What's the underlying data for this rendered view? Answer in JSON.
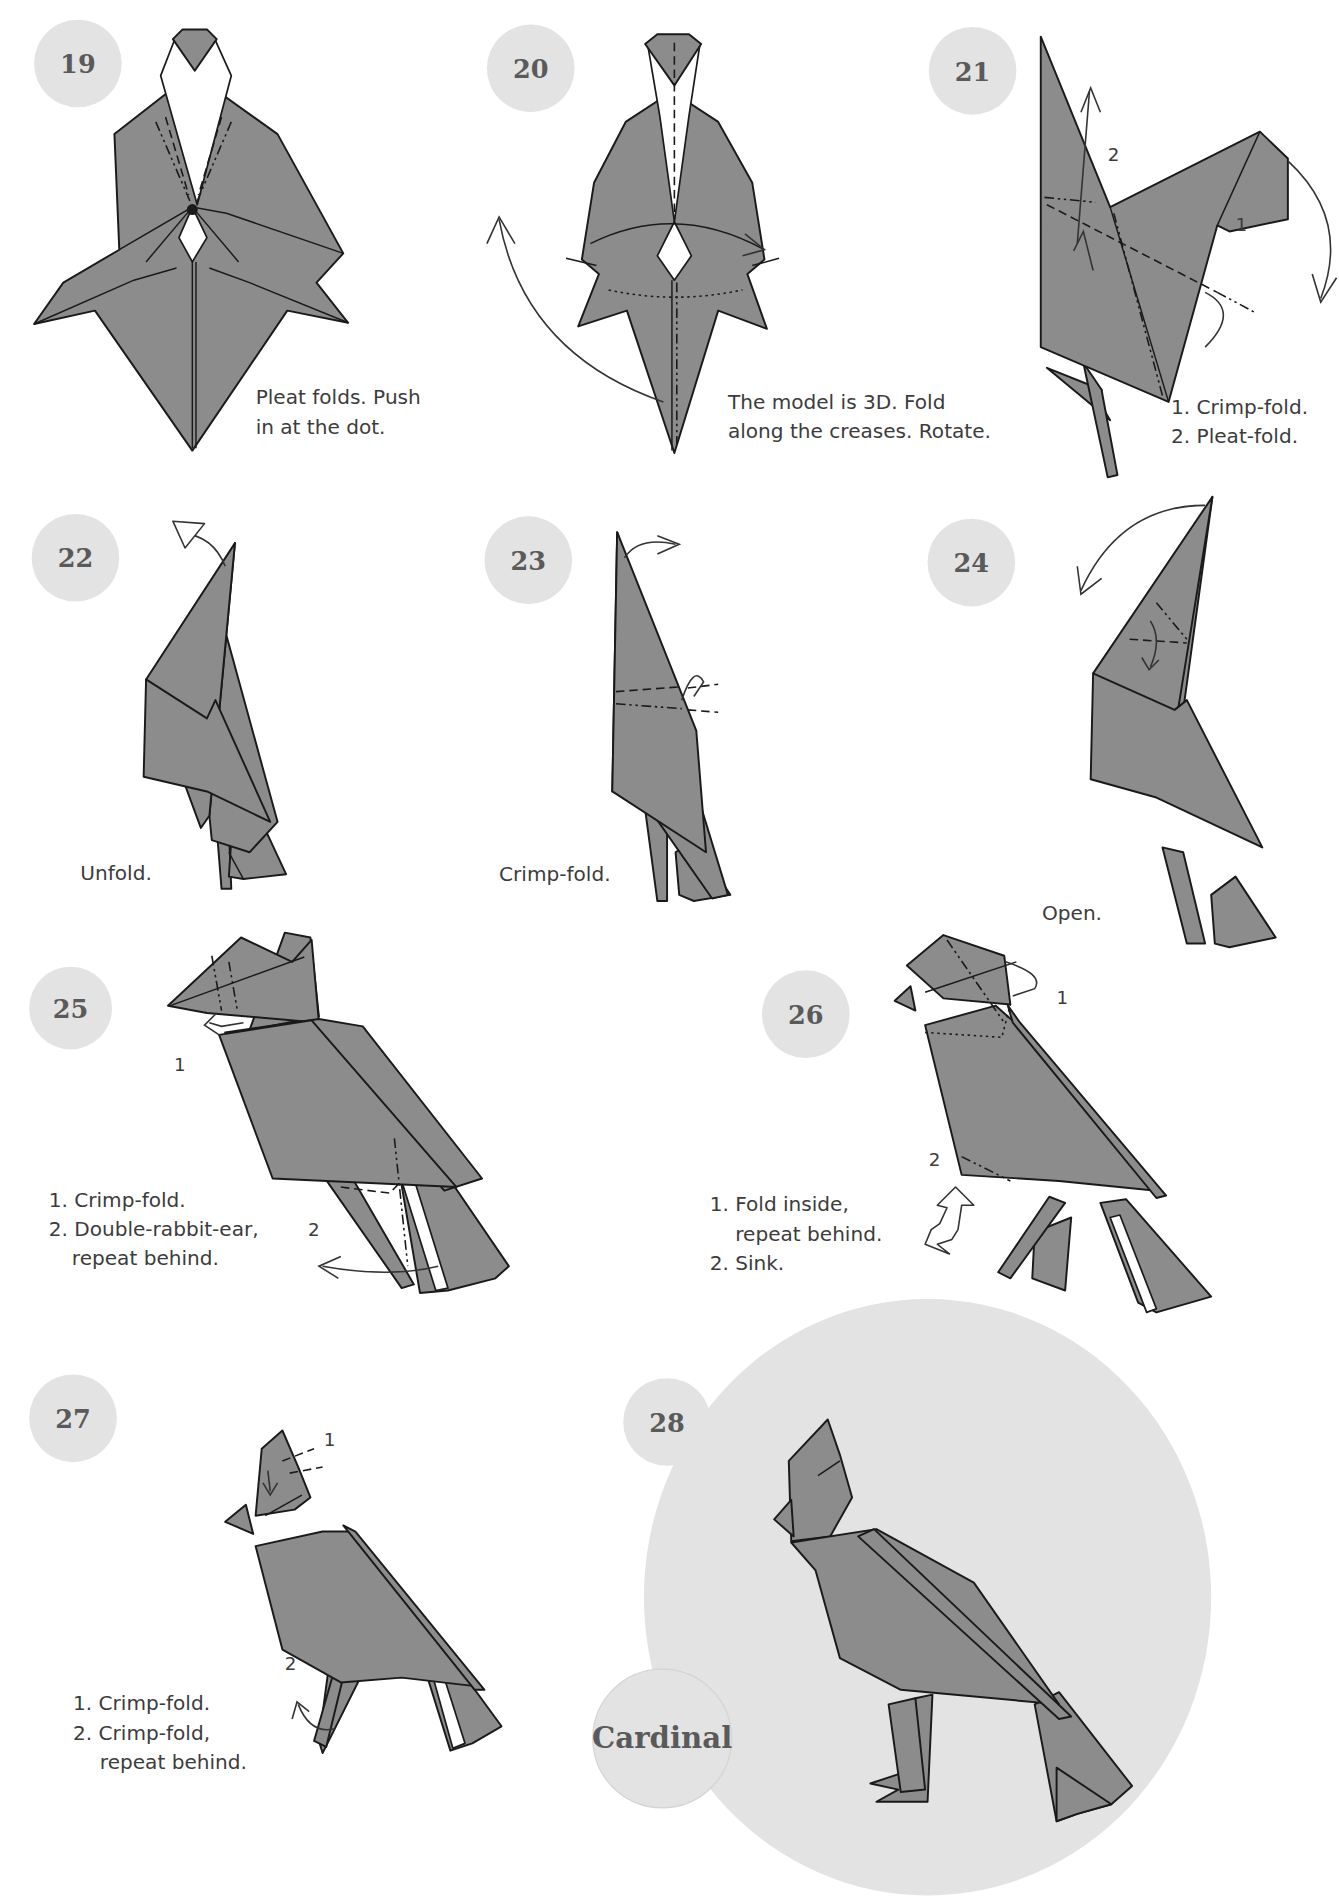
{
  "colors": {
    "background": "#ffffff",
    "badge": "#e3e3e3",
    "paper": "#8c8c8c",
    "outline": "#1a1a1a",
    "text": "#3c3c3c",
    "badge_text": "#5a5a5a"
  },
  "model_title": "Cardinal",
  "steps": [
    {
      "number": "19",
      "caption": [
        "Pleat folds. Push",
        "in at the dot."
      ],
      "labels": []
    },
    {
      "number": "20",
      "caption": [
        "The model is 3D. Fold",
        "along the creases. Rotate."
      ],
      "labels": []
    },
    {
      "number": "21",
      "caption": [
        "1. Crimp-fold.",
        "2. Pleat-fold."
      ],
      "labels": [
        "1",
        "2"
      ]
    },
    {
      "number": "22",
      "caption": [
        "Unfold."
      ],
      "labels": []
    },
    {
      "number": "23",
      "caption": [
        "Crimp-fold."
      ],
      "labels": []
    },
    {
      "number": "24",
      "caption": [
        "Open."
      ],
      "labels": []
    },
    {
      "number": "25",
      "caption": [
        "1. Crimp-fold.",
        "2. Double-rabbit-ear,",
        "repeat behind."
      ],
      "labels": [
        "1",
        "2"
      ]
    },
    {
      "number": "26",
      "caption": [
        "1. Fold inside,",
        "repeat behind.",
        "2. Sink."
      ],
      "labels": [
        "1",
        "2"
      ]
    },
    {
      "number": "27",
      "caption": [
        "1. Crimp-fold.",
        "2. Crimp-fold,",
        "repeat behind."
      ],
      "labels": [
        "1",
        "2"
      ]
    },
    {
      "number": "28",
      "caption": [],
      "labels": []
    }
  ]
}
